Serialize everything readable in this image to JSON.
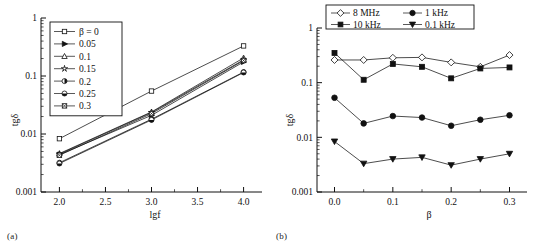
{
  "figure": {
    "panel_a_tag": "(a)",
    "panel_b_tag": "(b)"
  },
  "panel_a": {
    "ylabel": "tgδ",
    "xlabel": "lgf",
    "y_ticks": [
      "0.001",
      "0.01",
      "0.1",
      "1"
    ],
    "x_ticks": [
      "2.0",
      "2.5",
      "3.0",
      "3.5",
      "4.0"
    ],
    "legend": [
      {
        "label": "β = 0",
        "marker": "open-square"
      },
      {
        "label": "0.05",
        "marker": "filled-right-triangle"
      },
      {
        "label": "0.1",
        "marker": "open-triangle"
      },
      {
        "label": "0.15",
        "marker": "open-star"
      },
      {
        "label": "0.2",
        "marker": "half-filled-circle"
      },
      {
        "label": "0.25",
        "marker": "filled-half-circle"
      },
      {
        "label": "0.3",
        "marker": "crossed-square"
      }
    ]
  },
  "panel_b": {
    "ylabel": "tgδ",
    "xlabel": "β",
    "y_ticks": [
      "0.001",
      "0.01",
      "0.1",
      "1"
    ],
    "x_ticks": [
      "0.0",
      "0.1",
      "0.2",
      "0.3"
    ],
    "legend": [
      {
        "label": "8 MHz",
        "marker": "open-diamond"
      },
      {
        "label": "1 kHz",
        "marker": "filled-circle"
      },
      {
        "label": "10 kHz",
        "marker": "filled-square"
      },
      {
        "label": "0.1 kHz",
        "marker": "filled-down-triangle"
      }
    ]
  },
  "chart_data": [
    {
      "type": "line",
      "panel": "(a)",
      "title": "",
      "xlabel": "lgf",
      "ylabel": "tgδ",
      "xlim": [
        1.8,
        4.2
      ],
      "ylim": [
        0.001,
        1
      ],
      "yscale": "log",
      "xscale": "linear",
      "grid": false,
      "legend_position": "upper-left",
      "x": [
        2.0,
        3.0,
        4.0
      ],
      "series": [
        {
          "name": "β = 0",
          "marker": "open-square",
          "values": [
            0.0083,
            0.055,
            0.33
          ]
        },
        {
          "name": "0.05",
          "marker": "filled-right-triangle",
          "values": [
            0.0044,
            0.021,
            0.175
          ]
        },
        {
          "name": "0.1",
          "marker": "open-triangle",
          "values": [
            0.0046,
            0.024,
            0.205
          ]
        },
        {
          "name": "0.15",
          "marker": "open-star",
          "values": [
            0.0045,
            0.0235,
            0.19
          ]
        },
        {
          "name": "0.2",
          "marker": "half-filled-circle",
          "values": [
            0.0032,
            0.018,
            0.117
          ]
        },
        {
          "name": "0.25",
          "marker": "filled-half-circle",
          "values": [
            0.0031,
            0.0175,
            0.115
          ]
        },
        {
          "name": "0.3",
          "marker": "crossed-square",
          "values": [
            0.0043,
            0.0225,
            0.185
          ]
        }
      ]
    },
    {
      "type": "line",
      "panel": "(b)",
      "title": "",
      "xlabel": "β",
      "ylabel": "tgδ",
      "xlim": [
        -0.03,
        0.33
      ],
      "ylim": [
        0.001,
        1
      ],
      "yscale": "log",
      "xscale": "linear",
      "grid": false,
      "legend_position": "upper-center",
      "x": [
        0.0,
        0.05,
        0.1,
        0.15,
        0.2,
        0.25,
        0.3
      ],
      "series": [
        {
          "name": "8 MHz",
          "marker": "open-diamond",
          "values": [
            0.26,
            0.26,
            0.285,
            0.29,
            0.235,
            0.195,
            0.32
          ]
        },
        {
          "name": "10 kHz",
          "marker": "filled-square",
          "values": [
            0.35,
            0.113,
            0.22,
            0.195,
            0.12,
            0.182,
            0.19
          ]
        },
        {
          "name": "1 kHz",
          "marker": "filled-circle",
          "values": [
            0.053,
            0.018,
            0.0245,
            0.023,
            0.0163,
            0.021,
            0.0253
          ]
        },
        {
          "name": "0.1 kHz",
          "marker": "filled-down-triangle",
          "values": [
            0.0084,
            0.0033,
            0.004,
            0.0043,
            0.0031,
            0.004,
            0.005
          ]
        }
      ]
    }
  ]
}
